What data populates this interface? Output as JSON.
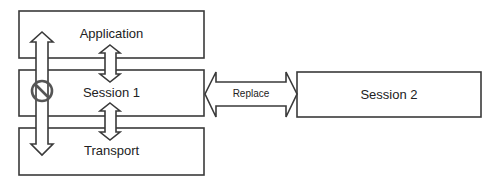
{
  "diagram": {
    "layers": [
      {
        "label": "Application"
      },
      {
        "label": "Session 1"
      },
      {
        "label": "Transport"
      }
    ],
    "replacement": {
      "label": "Session 2"
    },
    "replace_arrow": {
      "label": "Replace"
    },
    "blocked_arrow": {
      "icon": "prohibited-icon"
    },
    "colors": {
      "stroke": "#3a3a3a",
      "fill": "#ffffff",
      "prohibited": "#555555"
    }
  }
}
